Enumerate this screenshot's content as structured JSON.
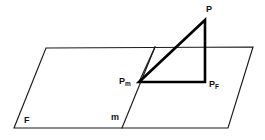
{
  "diagram": {
    "background_color": "#ffffff",
    "stroke_color": "#1a1a1a",
    "bold_stroke_color": "#000000",
    "width": 265,
    "height": 140,
    "labels": {
      "point_P": "P",
      "point_Pm_base": "P",
      "point_Pm_sub": "m",
      "point_PF_base": "P",
      "point_PF_sub": "F",
      "plane_F": "F",
      "line_m": "m"
    },
    "shapes": {
      "plane_parallelogram": {
        "name": "plane-F",
        "points": "46,48 253,47 228,128 14,128"
      },
      "line_m": {
        "name": "line-m",
        "x1": 155,
        "y1": 47,
        "x2": 122,
        "y2": 128
      },
      "thin_segment_top_to_Pm": {
        "name": "thin-edge-top-to-Pm",
        "x1": 155,
        "y1": 47,
        "x2": 139,
        "y2": 82
      },
      "vertical_segment_P_top": {
        "name": "vertical-through-plane",
        "x1": 205,
        "y1": 20,
        "x2": 205,
        "y2": 82
      },
      "triangle_bold": {
        "name": "triangle-P-Pm-PF",
        "points": "205,20 139,82 205,82"
      },
      "vertices": {
        "P": {
          "x": 205,
          "y": 20
        },
        "Pm": {
          "x": 139,
          "y": 82
        },
        "PF": {
          "x": 205,
          "y": 82
        }
      }
    }
  }
}
